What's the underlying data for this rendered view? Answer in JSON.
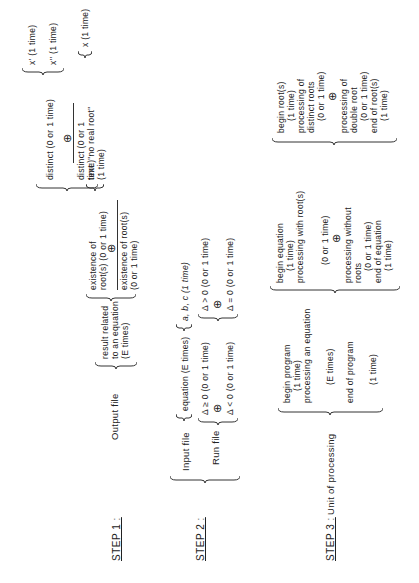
{
  "steps": [
    {
      "label": "STEP 1 :"
    },
    {
      "label": "STEP 2 :"
    },
    {
      "label": "STEP 3 :"
    }
  ],
  "step1": {
    "root": "Output file",
    "result": "result related\nto an equation\n(E times)",
    "existence": "existence of\nroot(s) (0 or 1 time)",
    "non_existence": "existence of root(s)\n(0 or 1 time)",
    "distinct": "distinct (0 or 1 time)",
    "not_distinct": "distinct (0 or 1\ntime)",
    "text_no_root": "text: \"no real root\"\n(1 time)",
    "x_prime": "x' (1 time)",
    "x_double_prime": "x'' (1 time)",
    "x_single": "x (1 time)",
    "oplus": "⊕"
  },
  "step2": {
    "input_file": "Input file",
    "equation": "equation (E times)",
    "coeffs": "a, b, c (1 time)",
    "run_file": "Run file",
    "delta_ge": "Δ ≥ 0 (0 or 1 time)",
    "delta_lt": "Δ < 0 (0 or 1 time)",
    "delta_gt": "Δ > 0 (0 or 1 time)",
    "delta_eq": "Δ = 0 (0 or 1 time)",
    "oplus": "⊕"
  },
  "step3": {
    "root": "Unit of processing",
    "program": [
      "begin program",
      "(1 time)",
      "processing an equation",
      "(E times)",
      "end of program",
      "(1 time)"
    ],
    "equation": [
      "begin equation",
      "(1 time)",
      "processing with root(s)",
      "(0 or 1 time)",
      "processing without",
      "roots",
      "(0 or 1 time)",
      "end of equation",
      "(1 time)"
    ],
    "roots": [
      "begin root(s)",
      "(1 time)",
      "processing of",
      "distinct roots",
      "(0 or 1 time)",
      "processing of",
      "double root",
      "(0 or 1 time)",
      "end of root(s)",
      "(1 time)"
    ],
    "oplus": "⊕"
  }
}
